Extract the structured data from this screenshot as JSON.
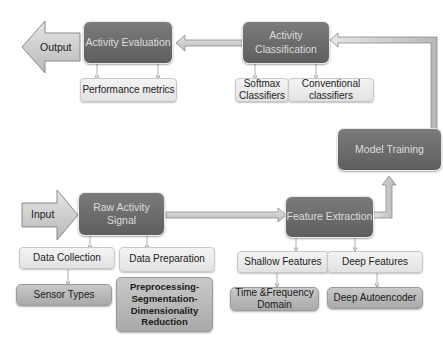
{
  "diagram": {
    "nodes": {
      "output": {
        "label": "Output",
        "kind": "block-arrow-left"
      },
      "input": {
        "label": "Input",
        "kind": "block-arrow-right"
      },
      "activity_evaluation": {
        "label": "Activity Evaluation"
      },
      "activity_classification": {
        "label": "Activity Classification"
      },
      "model_training": {
        "label": "Model Training"
      },
      "raw_activity_signal": {
        "label": "Raw Activity Signal"
      },
      "feature_extraction": {
        "label": "Feature Extraction"
      },
      "performance_metrics": {
        "label": "Performance metrics"
      },
      "softmax_classifiers": {
        "label": "Softmax Classifiers"
      },
      "conventional_classifiers": {
        "label": "Conventional classifiers"
      },
      "data_collection": {
        "label": "Data Collection"
      },
      "data_preparation": {
        "label": "Data Preparation"
      },
      "sensor_types": {
        "label": "Sensor Types"
      },
      "preprocessing": {
        "label": "Preprocessing-Segmentation-Dimensionality Reduction"
      },
      "shallow_features": {
        "label": "Shallow Features"
      },
      "deep_features": {
        "label": "Deep Features"
      },
      "time_frequency": {
        "label": "Time &Frequency Domain"
      },
      "deep_autoencoder": {
        "label": "Deep Autoencoder"
      }
    },
    "edges": [
      {
        "from": "input",
        "to": "raw_activity_signal"
      },
      {
        "from": "raw_activity_signal",
        "to": "feature_extraction"
      },
      {
        "from": "feature_extraction",
        "to": "model_training"
      },
      {
        "from": "model_training",
        "to": "activity_classification"
      },
      {
        "from": "activity_classification",
        "to": "activity_evaluation"
      },
      {
        "from": "activity_evaluation",
        "to": "output"
      },
      {
        "from": "activity_evaluation",
        "to": "performance_metrics"
      },
      {
        "from": "activity_classification",
        "to": "softmax_classifiers"
      },
      {
        "from": "activity_classification",
        "to": "conventional_classifiers"
      },
      {
        "from": "raw_activity_signal",
        "to": "data_collection"
      },
      {
        "from": "raw_activity_signal",
        "to": "data_preparation"
      },
      {
        "from": "data_collection",
        "to": "sensor_types"
      },
      {
        "from": "feature_extraction",
        "to": "shallow_features"
      },
      {
        "from": "feature_extraction",
        "to": "deep_features"
      },
      {
        "from": "shallow_features",
        "to": "time_frequency"
      },
      {
        "from": "deep_features",
        "to": "deep_autoencoder"
      }
    ],
    "colors": {
      "dark_node": "#6b6b6b",
      "light_node": "#ececec",
      "mid_node": "#b9b9b9",
      "arrow_fill": "#c8c8c8",
      "arrow_stroke": "#8a8a8a"
    }
  }
}
